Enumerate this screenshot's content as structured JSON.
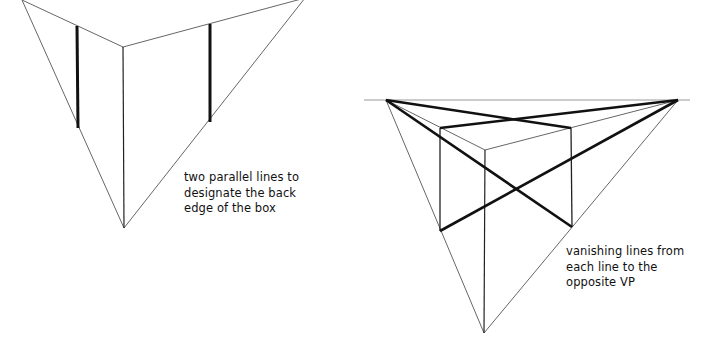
{
  "figures": [
    {
      "id": "step-back-edges",
      "caption": "two parallel lines to\ndesignate the back\nedge of the box",
      "points": {
        "vp_left": [
          22,
          0
        ],
        "vp_right": [
          305,
          -2
        ],
        "vp_bottom": [
          124,
          228
        ],
        "front_top": [
          123,
          47
        ]
      },
      "back_edges": [
        {
          "x": 77,
          "y1": 26,
          "y2": 128
        },
        {
          "x": 210,
          "y1": 24,
          "y2": 122
        }
      ]
    },
    {
      "id": "step-vanishing-lines",
      "caption": "vanishing lines from\neach line to the\nopposite VP",
      "points": {
        "horizon_start": [
          364,
          100
        ],
        "horizon_end": [
          690,
          100
        ],
        "vp_left": [
          386,
          100
        ],
        "vp_right": [
          678,
          100
        ],
        "vp_bottom": [
          484,
          333
        ],
        "front_top": [
          485,
          150
        ],
        "box_top_left": [
          440,
          128
        ],
        "box_top_right": [
          571,
          128
        ],
        "box_bottom_left": [
          440,
          231
        ],
        "box_bottom_right": [
          572,
          227
        ]
      }
    }
  ],
  "colors": {
    "thin_line": "#666666",
    "thick_line": "#111111",
    "text": "#111111",
    "background": "#ffffff"
  }
}
